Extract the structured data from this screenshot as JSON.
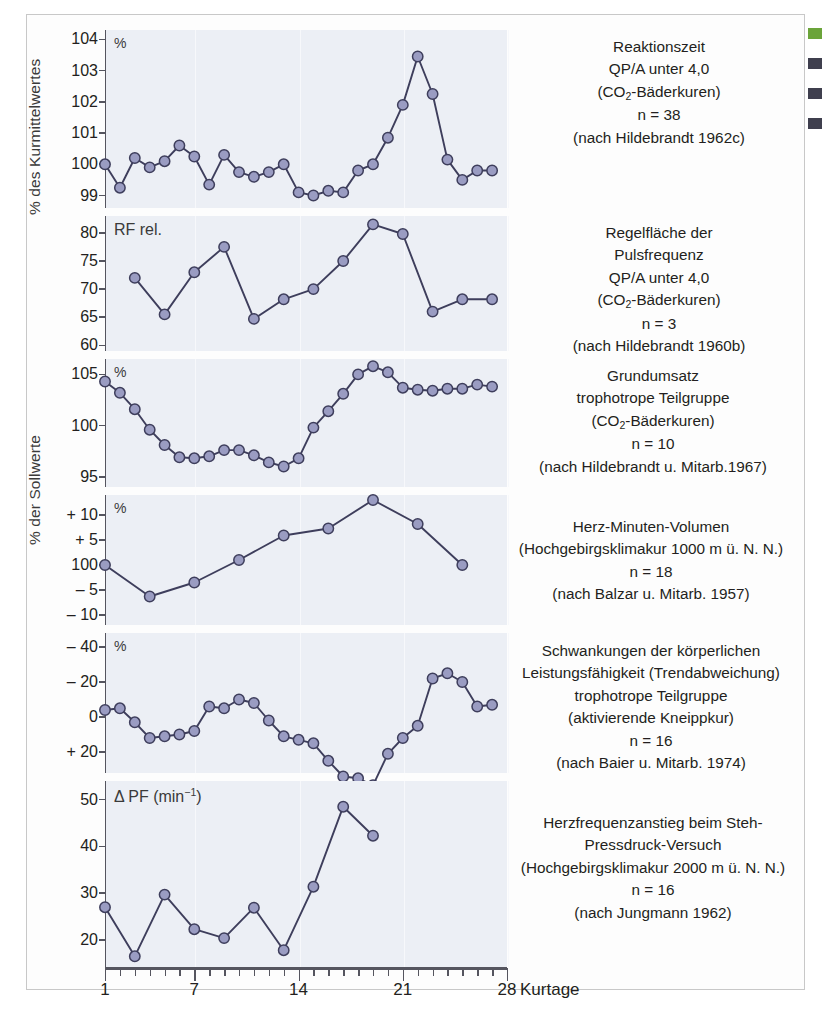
{
  "figure": {
    "axis_group_labels": [
      "% des Kurmittelwertes",
      "% der Sollwerte"
    ],
    "x_axis": {
      "title": "Kurtage",
      "tick_labels": [
        "1",
        "7",
        "14",
        "21",
        "28"
      ],
      "tick_values": [
        1,
        7,
        14,
        21,
        28
      ],
      "min": 1,
      "max": 28
    },
    "colors": {
      "marker_fill": "#9a9cc2",
      "marker_stroke": "#3e3e5c",
      "line": "#3e3e5c",
      "panel_background": "#eceff5",
      "axis": "#55555f",
      "text": "#231f20"
    },
    "edge_fragments": [
      "green",
      "dark",
      "dark",
      "dark"
    ]
  },
  "chart_data": [
    {
      "type": "line",
      "title": "Reaktionszeit",
      "caption_lines": [
        "Reaktionszeit",
        "QP/A unter 4,0",
        "(CO2-Bäderkuren)",
        "n = 38",
        "(nach Hildebrandt 1962c)"
      ],
      "n": 38,
      "source": "nach Hildebrandt 1962c",
      "ylabel": "%",
      "ytick_labels": [
        "104",
        "103",
        "102",
        "101",
        "100",
        "99"
      ],
      "ytick_values": [
        104,
        103,
        102,
        101,
        100,
        99
      ],
      "ylim": [
        98.6,
        104.3
      ],
      "xlabel": "Kurtage",
      "grid": true,
      "x": [
        1,
        2,
        3,
        4,
        5,
        6,
        7,
        8,
        9,
        10,
        11,
        12,
        13,
        14,
        15,
        16,
        17,
        18,
        19,
        20,
        21,
        22,
        23,
        24,
        25,
        26,
        27
      ],
      "values": [
        100.0,
        99.25,
        100.2,
        99.9,
        100.1,
        100.6,
        100.25,
        99.35,
        100.3,
        99.75,
        99.6,
        99.75,
        100.0,
        99.1,
        99.0,
        99.15,
        99.1,
        99.8,
        100.0,
        100.85,
        101.9,
        103.45,
        102.25,
        100.15,
        99.5,
        99.8,
        99.8
      ]
    },
    {
      "type": "line",
      "title": "Regelfläche der Pulsfrequenz",
      "caption_lines": [
        "Regelfläche der",
        "Pulsfrequenz",
        "QP/A unter 4,0",
        "(CO2-Bäderkuren)",
        "n = 3",
        "(nach Hildebrandt 1960b)"
      ],
      "n": 3,
      "source": "nach Hildebrandt 1960b",
      "ylabel": "RF rel.",
      "ytick_labels": [
        "80",
        "75",
        "70",
        "65",
        "60"
      ],
      "ytick_values": [
        80,
        75,
        70,
        65,
        60
      ],
      "ylim": [
        59,
        83
      ],
      "xlabel": "Kurtage",
      "grid": true,
      "x": [
        3,
        5,
        7,
        9,
        11,
        13,
        15,
        17,
        19,
        21,
        23,
        25,
        27
      ],
      "values": [
        72.0,
        65.5,
        73.0,
        77.5,
        64.7,
        68.2,
        70.0,
        75.0,
        81.5,
        79.8,
        66.0,
        68.2,
        68.2
      ]
    },
    {
      "type": "line",
      "title": "Grundumsatz",
      "caption_lines": [
        "Grundumsatz",
        "trophotrope Teilgruppe",
        "(CO2-Bäderkuren)",
        "n = 10",
        "(nach Hildebrandt u. Mitarb.1967)"
      ],
      "n": 10,
      "source": "nach Hildebrandt u. Mitarb.1967",
      "ylabel": "%",
      "ytick_labels": [
        "105",
        "100",
        "95"
      ],
      "ytick_values": [
        105,
        100,
        95
      ],
      "ylim": [
        94,
        106.5
      ],
      "xlabel": "Kurtage",
      "grid": true,
      "x": [
        1,
        2,
        3,
        4,
        5,
        6,
        7,
        8,
        9,
        10,
        11,
        12,
        13,
        14,
        15,
        16,
        17,
        18,
        19,
        20,
        21,
        22,
        23,
        24,
        25,
        26,
        27
      ],
      "values": [
        104.3,
        103.2,
        101.6,
        99.6,
        98.1,
        96.9,
        96.8,
        97.0,
        97.6,
        97.6,
        97.1,
        96.4,
        96.0,
        96.8,
        99.8,
        101.4,
        103.1,
        105.0,
        105.8,
        105.2,
        103.7,
        103.5,
        103.4,
        103.6,
        103.6,
        104.0,
        103.8
      ]
    },
    {
      "type": "line",
      "title": "Herz-Minuten-Volumen",
      "caption_lines": [
        "Herz-Minuten-Volumen",
        "(Hochgebirgsklimakur 1000 m ü. N. N.)",
        "n = 18",
        "(nach Balzar u. Mitarb. 1957)"
      ],
      "n": 18,
      "source": "nach Balzar u. Mitarb. 1957",
      "ylabel": "%",
      "ytick_labels": [
        "+ 10",
        "+ 5",
        "100",
        "– 5",
        "– 10"
      ],
      "ytick_values": [
        10,
        5,
        0,
        -5,
        -10
      ],
      "ylim": [
        -12,
        14
      ],
      "xlabel": "Kurtage",
      "grid": true,
      "x": [
        1,
        4,
        7,
        10,
        13,
        16,
        19,
        22,
        25
      ],
      "values": [
        0.0,
        -6.3,
        -3.5,
        1.0,
        5.9,
        7.3,
        13.0,
        8.2,
        0.0
      ]
    },
    {
      "type": "line",
      "title": "Schwankungen der körperlichen Leistungsfähigkeit",
      "caption_lines": [
        "Schwankungen der körperlichen",
        "Leistungsfähigkeit (Trendabweichung)",
        "trophotrope Teilgruppe",
        "(aktivierende Kneippkur)",
        "n = 16",
        "(nach Baier u. Mitarb. 1974)"
      ],
      "n": 16,
      "source": "nach Baier u. Mitarb. 1974",
      "ylabel": "%",
      "ytick_labels": [
        "– 40",
        "– 20",
        "0",
        "+ 20"
      ],
      "ytick_values": [
        -40,
        -20,
        0,
        20
      ],
      "ylim": [
        -48,
        32
      ],
      "note": "y-axis inverted: negative upward",
      "xlabel": "Kurtage",
      "grid": true,
      "x": [
        1,
        2,
        3,
        4,
        5,
        6,
        7,
        8,
        9,
        10,
        11,
        12,
        13,
        14,
        15,
        16,
        17,
        18,
        19,
        20,
        21,
        22,
        23,
        24,
        25,
        26,
        27
      ],
      "values": [
        -4,
        -5,
        3,
        12,
        11,
        10,
        8,
        -6,
        -5,
        -10,
        -8,
        2,
        11,
        13,
        15,
        25,
        34,
        35,
        39,
        21,
        12,
        5,
        -22,
        -25,
        -20,
        -6,
        -7
      ]
    },
    {
      "type": "line",
      "title": "Herzfrequenzanstieg beim Steh-Pressdruck-Versuch",
      "caption_lines": [
        "Herzfrequenzanstieg beim Steh-",
        "Pressdruck-Versuch",
        "(Hochgebirgsklimakur 2000 m ü. N. N.)",
        "n = 16",
        "(nach Jungmann 1962)"
      ],
      "n": 16,
      "source": "nach Jungmann 1962",
      "ylabel": "Δ PF (min-1)",
      "ytick_labels": [
        "50",
        "40",
        "30",
        "20"
      ],
      "ytick_values": [
        50,
        40,
        30,
        20
      ],
      "ylim": [
        14,
        54
      ],
      "xlabel": "Kurtage",
      "grid": true,
      "x": [
        1,
        3,
        5,
        7,
        9,
        11,
        13,
        15,
        17,
        19
      ],
      "values": [
        27.0,
        16.5,
        29.7,
        22.3,
        20.4,
        26.9,
        17.8,
        31.4,
        48.5,
        42.3
      ]
    }
  ]
}
